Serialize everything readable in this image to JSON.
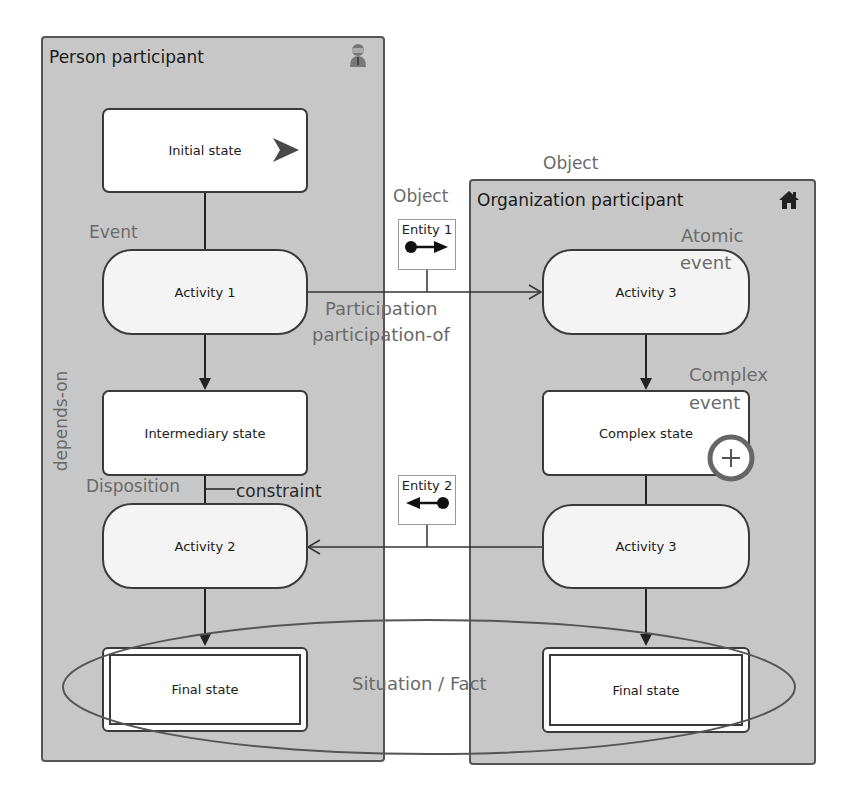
{
  "panels": {
    "person": {
      "title": "Person participant",
      "icon": "person-icon"
    },
    "organization": {
      "title": "Organization participant",
      "icon": "house-icon"
    }
  },
  "nodes": {
    "initial_state": "Initial state",
    "activity_1": "Activity 1",
    "intermediary_state": "Intermediary state",
    "activity_2": "Activity 2",
    "final_state_left": "Final state",
    "activity_3_top": "Activity 3",
    "complex_state": "Complex state",
    "activity_3_bottom": "Activity 3",
    "final_state_right": "Final state"
  },
  "entities": {
    "entity_1": {
      "label": "Entity 1",
      "direction": "right"
    },
    "entity_2": {
      "label": "Entity 2",
      "direction": "left"
    }
  },
  "annotations": {
    "event": "Event",
    "depends_on": "depends-on",
    "disposition": "Disposition",
    "constraint": "constraint",
    "object_left": "Object",
    "object_top": "Object",
    "participation": "Participation",
    "participation_of": "participation-of",
    "atomic_event_1": "Atomic",
    "atomic_event_2": "event",
    "complex_event_1": "Complex",
    "complex_event_2": "event",
    "situation_fact": "Situation / Fact"
  },
  "colors": {
    "panel_bg": "#c7c7c7",
    "border": "#3a3a3a",
    "annotation": "#6a6a6a",
    "start_arrow": "#4a4a4a"
  }
}
